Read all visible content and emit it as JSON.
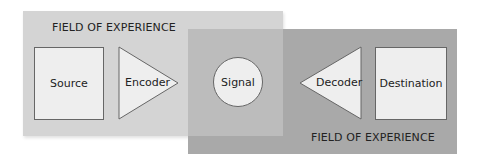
{
  "diagram": {
    "fields": [
      {
        "id": "left",
        "label": "FIELD OF EXPERIENCE"
      },
      {
        "id": "right",
        "label": "FIELD OF EXPERIENCE"
      }
    ],
    "nodes": [
      {
        "id": "source",
        "shape": "square",
        "label": "Source"
      },
      {
        "id": "encoder",
        "shape": "triangle-right",
        "label": "Encoder"
      },
      {
        "id": "signal",
        "shape": "circle",
        "label": "Signal"
      },
      {
        "id": "decoder",
        "shape": "triangle-left",
        "label": "Decoder"
      },
      {
        "id": "destination",
        "shape": "square",
        "label": "Destination"
      }
    ],
    "colors": {
      "left_field": "#d4d4d4",
      "right_field": "#a9a9a9",
      "overlap": "#bcbcbc",
      "node_fill": "#eeeeee",
      "node_stroke": "#666666"
    }
  }
}
